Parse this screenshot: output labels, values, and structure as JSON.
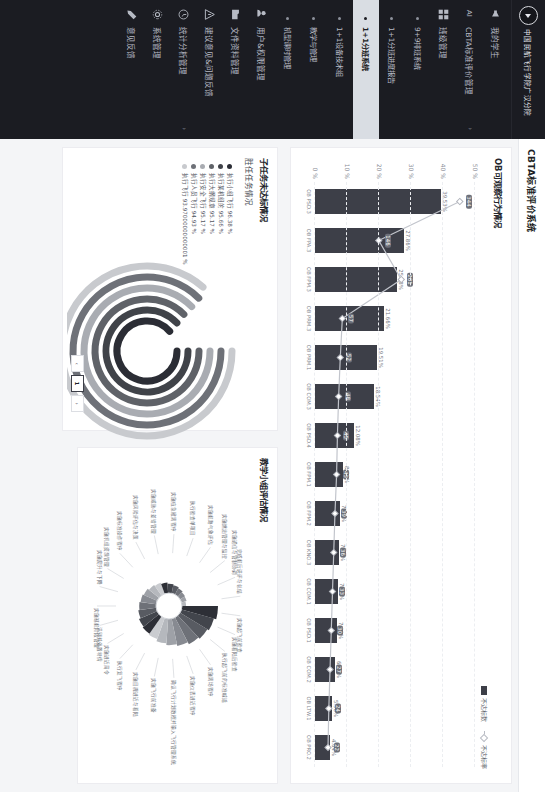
{
  "sidebar": {
    "brand": "中国民航飞行学院广汉分院",
    "brand_icon": "plane-circle-icon",
    "items": [
      {
        "label": "我的学生",
        "icon": "megaphone-icon",
        "caret": "",
        "type": "item"
      },
      {
        "label": "CBTA标准评价管理",
        "icon": "ai-icon",
        "caret": "›",
        "type": "item"
      },
      {
        "label": "班级管理",
        "icon": "grid-icon",
        "caret": "",
        "type": "item"
      },
      {
        "label": "9+9排班系统",
        "icon": "dot",
        "caret": "",
        "type": "sub"
      },
      {
        "label": "1+1分班进度报告",
        "icon": "dot",
        "caret": "",
        "type": "sub"
      },
      {
        "label": "1+1分班系统",
        "icon": "dot",
        "caret": "",
        "type": "sub",
        "active": true
      },
      {
        "label": "1+1设备技术组",
        "icon": "dot",
        "caret": "",
        "type": "sub"
      },
      {
        "label": "教学与管理",
        "icon": "dot",
        "caret": "",
        "type": "sub"
      },
      {
        "label": "机型课时管理",
        "icon": "dot",
        "caret": "",
        "type": "sub"
      },
      {
        "label": "用户&权限管理",
        "icon": "users-icon",
        "caret": "",
        "type": "item"
      },
      {
        "label": "文件资料管理",
        "icon": "folder-icon",
        "caret": "",
        "type": "item"
      },
      {
        "label": "建议意见&问题反馈",
        "icon": "warning-icon",
        "caret": "",
        "type": "item"
      },
      {
        "label": "统计分析管理",
        "icon": "clock-icon",
        "caret": "›",
        "type": "item"
      },
      {
        "label": "系统管理",
        "icon": "gear-icon",
        "caret": "",
        "type": "item"
      },
      {
        "label": "意见反馈",
        "icon": "pen-icon",
        "caret": "",
        "type": "item"
      }
    ]
  },
  "topbar": {
    "title": "CBTA标准评价系统"
  },
  "panel1": {
    "heading": "OB可观察行为情况"
  },
  "panel2": {
    "heading": "子任务未达标情况"
  },
  "panel3": {
    "heading": "胜任任务情况"
  },
  "panel4": {
    "heading": "教学小组评估情况"
  },
  "pager": {
    "prev": "‹",
    "current": "1",
    "next": "›"
  },
  "chart_data": [
    {
      "type": "bar",
      "id": "ob-behaviour",
      "title": "OB可观察行为情况",
      "xlabel": "",
      "ylabel": "占比",
      "ylim": [
        0,
        50
      ],
      "yticks": [
        "0 %",
        "10 %",
        "20 %",
        "30 %",
        "40 %",
        "50 %"
      ],
      "grid": true,
      "legend": [
        "不达标数",
        "不达标率"
      ],
      "legend_position": "top-right",
      "categories": [
        "OB PSD.3",
        "OB FPA.3",
        "OB FPM.3",
        "OB PRM.3",
        "OB PRM.1",
        "OB COM.3",
        "OB PSD.4",
        "OB FPM.1",
        "OB FPM.2",
        "OB KNO.3",
        "OB COM.1",
        "OB PSD.1",
        "OB COM.2",
        "OB LTW.1",
        "OB PRO.2"
      ],
      "series": [
        {
          "name": "不达标数",
          "type": "bar",
          "values": [
            39.53,
            27.86,
            25.48,
            21.66,
            19.51,
            18.54,
            12.08,
            8.7,
            7.87,
            7.64,
            7.23,
            7.0,
            6.28,
            5.38,
            4.64
          ]
        },
        {
          "name": "不达标率",
          "type": "line",
          "values": [
            344,
            146,
            201,
            57,
            52,
            48,
            45,
            43,
            39,
            36,
            33,
            30,
            27,
            24,
            22
          ]
        }
      ],
      "bar_labels": [
        "39.53%",
        "27.86%",
        "25.48%",
        "21.66%",
        "19.51%",
        "18.54%",
        "12.08%",
        "8.70%",
        "7.87%",
        "7.64%",
        "7.23%",
        "7.00%",
        "6.28%",
        "5.38%",
        "4.64%",
        "3.29%",
        "2.92%",
        "1.48%",
        "1.48%",
        "0.22%"
      ],
      "point_labels": [
        "344",
        "146",
        "201",
        "57",
        "52",
        "48",
        "45",
        "43",
        "39",
        "36",
        "33",
        "30",
        "27",
        "24",
        "22"
      ]
    },
    {
      "type": "pie",
      "id": "task-competency",
      "title": "胜任任务情况",
      "legend_position": "left",
      "legend": [
        {
          "label": "执行小组飞行 96.38 %",
          "color": "#2b2d35",
          "value": 96.38
        },
        {
          "label": "执行某机组的 95.66 %",
          "color": "#404349",
          "value": 95.66
        },
        {
          "label": "执行大纲规章 95.17 %",
          "color": "#5f6268",
          "value": 95.17
        },
        {
          "label": "执行安全飞行 95.17 %",
          "color": "#a9acb2",
          "value": 95.17
        },
        {
          "label": "执行人员飞行 94.93 %",
          "color": "#6e7178",
          "value": 94.93
        },
        {
          "label": "执行飞行 93.97000000000001 %",
          "color": "#c8cace",
          "value": 93.97
        }
      ],
      "values": [
        96.38,
        95.66,
        95.17,
        95.17,
        94.93,
        93.97
      ]
    },
    {
      "type": "pie",
      "id": "teaching-group-rose",
      "title": "教学小组评估情况",
      "chart_style": "nightingale-rose",
      "labels": [
        "实施起飞前检查",
        "实施着陆后检查",
        "执行起飞前的标准喊话",
        "实施离场程序",
        "实施仪表进近程序",
        "确认飞行计划数据并输入飞行管理系统",
        "实施飞行前准备",
        "实施目视进近与着陆",
        "执行复飞程序",
        "实施进近简令",
        "识别并处置特情",
        "实施巡航阶段管理",
        "实施爬升与下降",
        "实施机组资源管理",
        "实施标准操作程序",
        "实施风险评估与决策",
        "实施威胁与差错管理",
        "实施应急撤离程序",
        "执行检查单项目",
        "实施航路气象评估",
        "实施燃油管理与监控",
        "实施通信与管制协调",
        "完成航后讲评与总结"
      ],
      "values": [
        62,
        58,
        55,
        52,
        48,
        45,
        42,
        38,
        36,
        34,
        31,
        29,
        27,
        25,
        22,
        20,
        18,
        16,
        14,
        12,
        10,
        9,
        7
      ]
    }
  ]
}
